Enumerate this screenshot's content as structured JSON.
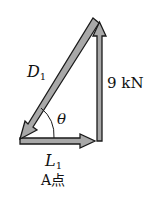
{
  "diagram": {
    "type": "force-triangle",
    "labels": {
      "diagonal_force": "D",
      "diagonal_sub": "1",
      "vertical_force": "9 kN",
      "angle": "θ",
      "horizontal_force": "L",
      "horizontal_sub": "1",
      "point": "A点"
    },
    "colors": {
      "arrow_fill": "#9a9a9a",
      "arrow_stroke": "#1a1a1a",
      "text": "#111111",
      "background": "#ffffff"
    }
  }
}
